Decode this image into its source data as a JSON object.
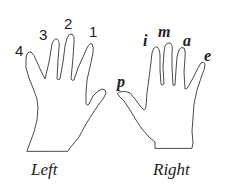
{
  "diagram": {
    "hands": [
      {
        "name": "left",
        "caption": "Left",
        "finger_labels": [
          {
            "finger": "pinky",
            "label": "4"
          },
          {
            "finger": "ring",
            "label": "3"
          },
          {
            "finger": "middle",
            "label": "2"
          },
          {
            "finger": "index",
            "label": "1"
          }
        ]
      },
      {
        "name": "right",
        "caption": "Right",
        "finger_labels": [
          {
            "finger": "thumb",
            "label": "p"
          },
          {
            "finger": "index",
            "label": "i"
          },
          {
            "finger": "middle",
            "label": "m"
          },
          {
            "finger": "ring",
            "label": "a"
          },
          {
            "finger": "pinky",
            "label": "e"
          }
        ]
      }
    ],
    "colors": {
      "outline": "#4a4a4a",
      "text": "#222222",
      "background": "#ffffff"
    }
  }
}
